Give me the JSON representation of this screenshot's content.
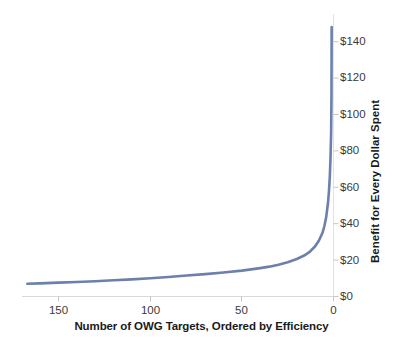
{
  "chart_data": {
    "type": "line",
    "title": "",
    "subtitle": "",
    "xlabel": "Number of OWG Targets, Ordered by Efficiency",
    "ylabel": "Benefit for Every Dollar Spent",
    "xlim": [
      170,
      0
    ],
    "ylim": [
      0,
      150
    ],
    "x_axis_reversed": true,
    "grid": false,
    "legend": null,
    "legend_position": "none",
    "x_ticks": [
      {
        "value": 150,
        "label": "150"
      },
      {
        "value": 100,
        "label": "100"
      },
      {
        "value": 50,
        "label": "50"
      },
      {
        "value": 0,
        "label": "0"
      }
    ],
    "y_ticks": [
      {
        "value": 0,
        "label": "$0"
      },
      {
        "value": 20,
        "label": "$20"
      },
      {
        "value": 40,
        "label": "$40"
      },
      {
        "value": 60,
        "label": "$60"
      },
      {
        "value": 80,
        "label": "$80"
      },
      {
        "value": 100,
        "label": "$100"
      },
      {
        "value": 120,
        "label": "$120"
      },
      {
        "value": 140,
        "label": "$140"
      }
    ],
    "series": [
      {
        "name": "Benefit per dollar",
        "color": "#6B80AC",
        "line_width": 2.6,
        "x": [
          167,
          160,
          150,
          140,
          130,
          120,
          110,
          100,
          90,
          80,
          70,
          60,
          50,
          45,
          40,
          35,
          30,
          25,
          20,
          16,
          13,
          10,
          8,
          6,
          5,
          4,
          3,
          2.5,
          2,
          1.6,
          1.3,
          1.1,
          1.0
        ],
        "y": [
          7.0,
          7.2,
          7.6,
          8.0,
          8.4,
          8.9,
          9.4,
          10.0,
          10.7,
          11.5,
          12.3,
          13.2,
          14.2,
          14.9,
          15.6,
          16.4,
          17.5,
          18.8,
          20.6,
          22.5,
          24.5,
          27.6,
          30.6,
          35.0,
          38.6,
          43.5,
          51.5,
          57.5,
          66.0,
          77.0,
          90.0,
          110.0,
          148.0
        ]
      }
    ]
  },
  "axes": {
    "x_tick_labels": [
      "150",
      "100",
      "50",
      "0"
    ],
    "y_tick_labels": [
      "$0",
      "$20",
      "$40",
      "$60",
      "$80",
      "$100",
      "$120",
      "$140"
    ],
    "x_title": "Number of OWG Targets, Ordered by Efficiency",
    "y_title": "Benefit for Every Dollar Spent"
  },
  "colors": {
    "series_line": "#6B80AC",
    "axis_line": "#D4D4D4",
    "tick_mark": "#BFBFBF",
    "tick_text": "#3a3a3a",
    "title_text": "#1a1a1a",
    "background": "#ffffff"
  }
}
